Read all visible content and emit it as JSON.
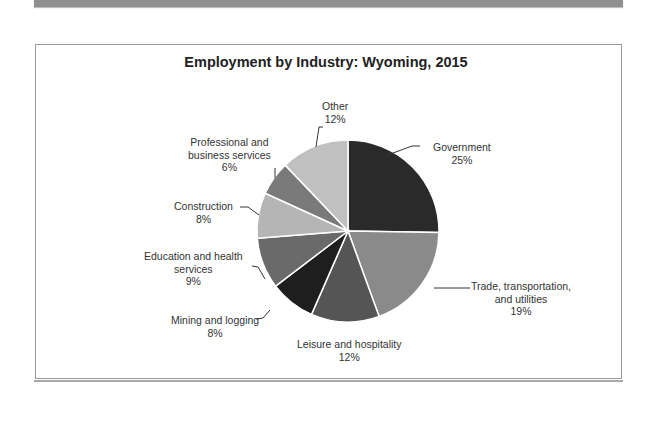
{
  "chart_data": {
    "type": "pie",
    "title": "Employment by Industry: Wyoming, 2015",
    "categories": [
      "Government",
      "Trade, transportation, and utilities",
      "Leisure and hospitality",
      "Mining and logging",
      "Education and health services",
      "Construction",
      "Professional and business services",
      "Other"
    ],
    "values": [
      25,
      19,
      12,
      8,
      9,
      8,
      6,
      12
    ],
    "unit": "%",
    "colors": [
      "#2a2a2a",
      "#8a8a8a",
      "#555555",
      "#1e1e1e",
      "#6a6a6a",
      "#b5b5b5",
      "#7a7a7a",
      "#c0c0c0"
    ],
    "start_angle": "12 o'clock, clockwise",
    "legend": "none (leader-line data labels)"
  },
  "labels": {
    "government": {
      "line1": "Government",
      "pct": "25%"
    },
    "trade": {
      "line1": "Trade, transportation,",
      "line2": "and utilities",
      "pct": "19%"
    },
    "leisure": {
      "line1": "Leisure and hospitality",
      "pct": "12%"
    },
    "mining": {
      "line1": "Mining and logging",
      "pct": "8%"
    },
    "education": {
      "line1": "Education and health",
      "line2": "services",
      "pct": "9%"
    },
    "construction": {
      "line1": "Construction",
      "pct": "8%"
    },
    "professional": {
      "line1": "Professional and",
      "line2": "business services",
      "pct": "6%"
    },
    "other": {
      "line1": "Other",
      "pct": "12%"
    }
  }
}
